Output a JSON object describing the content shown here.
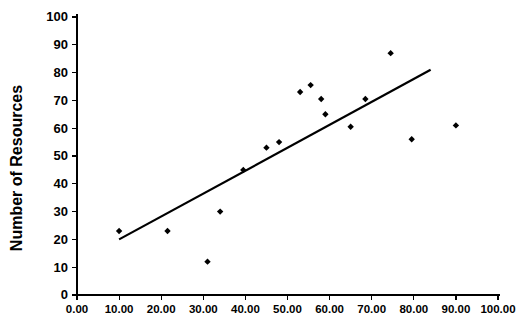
{
  "chart_data": {
    "type": "scatter",
    "title": "",
    "xlabel": "",
    "ylabel": "Number of Resources",
    "xlim": [
      0,
      100
    ],
    "ylim": [
      0,
      100
    ],
    "grid": false,
    "legend": "none",
    "xticks": [
      0,
      10,
      20,
      30,
      40,
      50,
      60,
      70,
      80,
      90,
      100
    ],
    "xtick_labels": [
      "0.00",
      "10.00",
      "20.00",
      "30.00",
      "40.00",
      "50.00",
      "60.00",
      "70.00",
      "80.00",
      "90.00",
      "100.00"
    ],
    "yticks": [
      0,
      10,
      20,
      30,
      40,
      50,
      60,
      70,
      80,
      90,
      100
    ],
    "ytick_labels": [
      "0",
      "10",
      "20",
      "30",
      "40",
      "50",
      "60",
      "70",
      "80",
      "90",
      "100"
    ],
    "marker_shape": "diamond",
    "marker_color": "#000000",
    "points": [
      {
        "x": 10.0,
        "y": 23.0
      },
      {
        "x": 21.5,
        "y": 23.0
      },
      {
        "x": 31.0,
        "y": 12.0
      },
      {
        "x": 34.0,
        "y": 30.0
      },
      {
        "x": 39.5,
        "y": 45.0
      },
      {
        "x": 45.0,
        "y": 53.0
      },
      {
        "x": 48.0,
        "y": 55.0
      },
      {
        "x": 53.0,
        "y": 73.0
      },
      {
        "x": 55.5,
        "y": 75.5
      },
      {
        "x": 58.0,
        "y": 70.5
      },
      {
        "x": 59.0,
        "y": 65.0
      },
      {
        "x": 65.0,
        "y": 60.5
      },
      {
        "x": 68.5,
        "y": 70.5
      },
      {
        "x": 74.5,
        "y": 87.0
      },
      {
        "x": 79.5,
        "y": 56.0
      },
      {
        "x": 90.0,
        "y": 61.0
      }
    ],
    "trend_line": {
      "color": "#000000",
      "x_start": 10.0,
      "y_start": 20.0,
      "x_end": 84.0,
      "y_end": 81.0
    }
  }
}
